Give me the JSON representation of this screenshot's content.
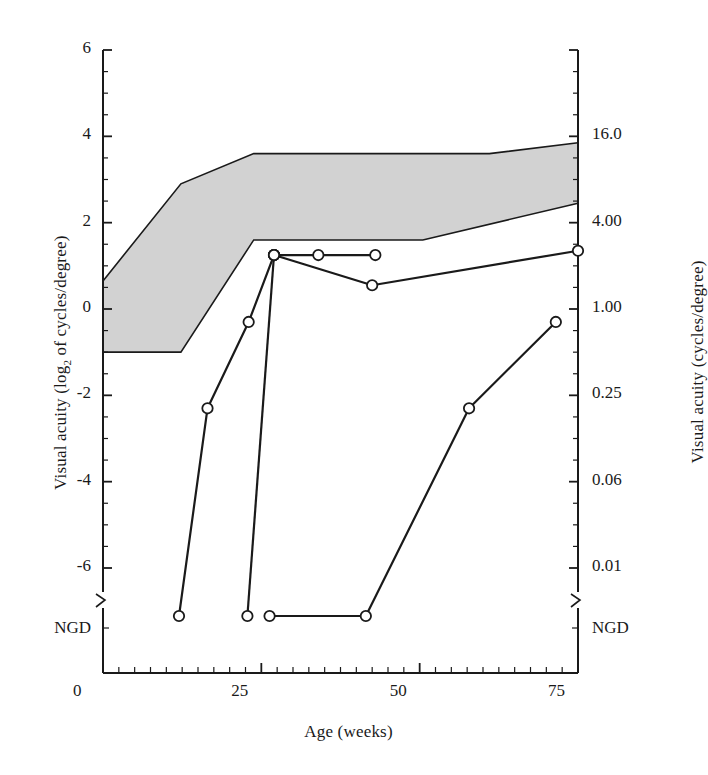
{
  "chart_data": {
    "type": "line",
    "title": "",
    "xlabel": "Age (weeks)",
    "ylabel_left": "Visual acuity (log2 of cycles/degree)",
    "ylabel_right": "Visual acuity (cycles/degree)",
    "xlim": [
      0,
      75
    ],
    "xticks": [
      0,
      25,
      50,
      75
    ],
    "xticklabels": [
      "0",
      "25",
      "50",
      "75"
    ],
    "x_minor_tick_step": 2.5,
    "ylim": [
      -7,
      6
    ],
    "yticks_left": [
      6,
      4,
      2,
      0,
      -2,
      -4,
      -6
    ],
    "yticklabels_left": [
      "6",
      "4",
      "2",
      "0",
      "-2",
      "-4",
      "-6"
    ],
    "y_below_break_label_left": "NGD",
    "yticks_right": [
      4,
      2,
      0,
      -2,
      -4,
      -6
    ],
    "yticklabels_right": [
      "16.0",
      "4.00",
      "1.00",
      "0.25",
      "0.06",
      "0.01"
    ],
    "y_below_break_label_right": "NGD",
    "axis_break": true,
    "grid": false,
    "legend": false,
    "band": {
      "name": "normal range (shaded)",
      "fill_color": "#d2d2d2",
      "edge_color": "#1a1a1a",
      "upper": [
        {
          "x": 0,
          "y": 0.65
        },
        {
          "x": 12.3,
          "y": 2.9
        },
        {
          "x": 23.8,
          "y": 3.6
        },
        {
          "x": 61.0,
          "y": 3.6
        },
        {
          "x": 75,
          "y": 3.85
        }
      ],
      "lower": [
        {
          "x": 0,
          "y": -1.0
        },
        {
          "x": 12.3,
          "y": -1.0
        },
        {
          "x": 23.8,
          "y": 1.6
        },
        {
          "x": 50.5,
          "y": 1.6
        },
        {
          "x": 75,
          "y": 2.45
        }
      ]
    },
    "series": [
      {
        "name": "subject-1",
        "marker": "open-circle",
        "points": [
          {
            "x": 12.0,
            "y": -7.0,
            "label": "NGD"
          },
          {
            "x": 16.5,
            "y": -2.3
          },
          {
            "x": 23.0,
            "y": -0.3
          },
          {
            "x": 27.0,
            "y": 1.25
          }
        ]
      },
      {
        "name": "subject-2",
        "marker": "open-circle",
        "points": [
          {
            "x": 22.8,
            "y": -7.0,
            "label": "NGD"
          },
          {
            "x": 27.0,
            "y": 1.25
          }
        ]
      },
      {
        "name": "subject-3",
        "marker": "open-circle",
        "points": [
          {
            "x": 27.0,
            "y": 1.25
          },
          {
            "x": 34.0,
            "y": 1.25
          },
          {
            "x": 43.0,
            "y": 1.25
          }
        ]
      },
      {
        "name": "subject-4",
        "marker": "open-circle",
        "points": [
          {
            "x": 27.0,
            "y": 1.25
          },
          {
            "x": 42.5,
            "y": 0.55
          },
          {
            "x": 75.0,
            "y": 1.35
          }
        ]
      },
      {
        "name": "subject-5",
        "marker": "open-circle",
        "points": [
          {
            "x": 26.3,
            "y": -7.0,
            "label": "NGD"
          },
          {
            "x": 41.5,
            "y": -7.0,
            "label": "NGD"
          },
          {
            "x": 57.8,
            "y": -2.3
          },
          {
            "x": 71.5,
            "y": -0.3
          }
        ]
      }
    ]
  },
  "figure": {
    "background_color": "#ffffff",
    "line_color": "#1a1a1a",
    "marker_face_color": "#ffffff"
  }
}
